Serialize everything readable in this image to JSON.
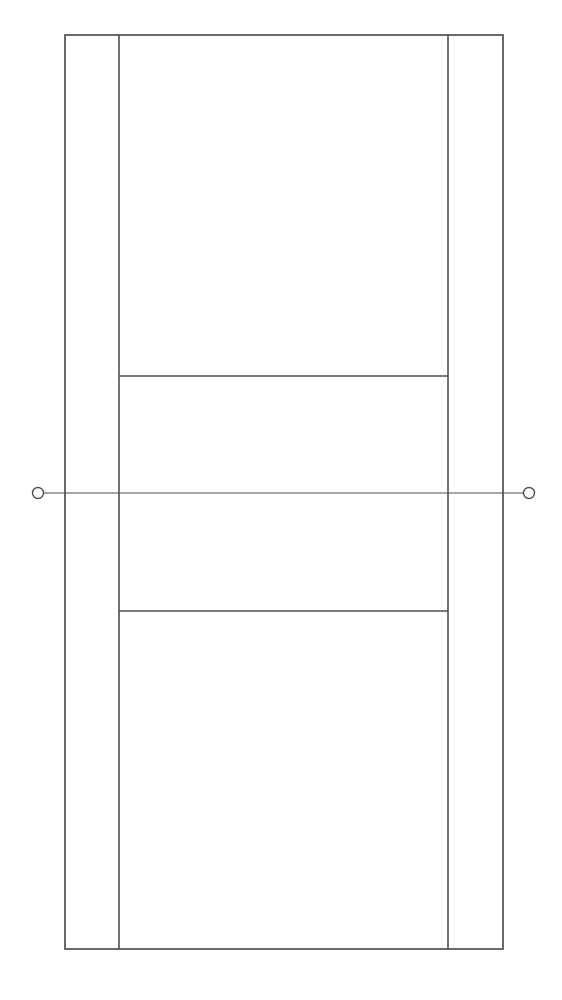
{
  "diagram": {
    "type": "tennis-court-plan",
    "orientation": "portrait",
    "background_color": "#ffffff",
    "line_color": "#4f4f4f",
    "canvas": {
      "width": 562,
      "height": 1000
    },
    "geometry": {
      "outer_boundary": {
        "left": 65,
        "top": 35,
        "right": 503,
        "bottom": 949
      },
      "singles_sideline_left_x": 119,
      "singles_sideline_right_x": 448,
      "service_line_top_y": 376,
      "service_line_bottom_y": 611,
      "net_line_y": 493,
      "net_line_left_x": 38,
      "net_line_right_x": 529,
      "net_post_radius": 5.5,
      "net_post_left": {
        "cx": 38,
        "cy": 493
      },
      "net_post_right": {
        "cx": 529,
        "cy": 493
      }
    },
    "elements": {
      "outer_boundary_label": "Doubles court boundary",
      "left_alley_label": "Left doubles alley",
      "right_alley_label": "Right doubles alley",
      "singles_sideline_left_label": "Left singles sideline",
      "singles_sideline_right_label": "Right singles sideline",
      "service_line_top_label": "Far service line",
      "service_line_bottom_label": "Near service line",
      "net_line_label": "Net line",
      "net_post_left_label": "Left net post",
      "net_post_right_label": "Right net post",
      "baseline_top_label": "Far baseline",
      "baseline_bottom_label": "Near baseline"
    }
  }
}
